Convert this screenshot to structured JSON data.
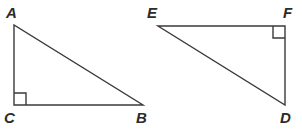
{
  "figure": {
    "background_color": "#ffffff",
    "stroke_color": "#3a3a3a",
    "stroke_width": 1.4,
    "label_color": "#2b2b2b",
    "canvas": {
      "width": 302,
      "height": 132
    },
    "shapes": [
      {
        "name": "triangle-acb",
        "type": "right-triangle",
        "vertices": [
          {
            "id": "A",
            "label": "A",
            "x": 14,
            "y": 25,
            "label_x": 6,
            "label_y": 5
          },
          {
            "id": "C",
            "label": "C",
            "x": 14,
            "y": 105,
            "label_x": 4,
            "label_y": 110
          },
          {
            "id": "B",
            "label": "B",
            "x": 143,
            "y": 105,
            "label_x": 136,
            "label_y": 110
          }
        ],
        "right_angle_at": "C",
        "right_angle_marker": {
          "x": 14,
          "y": 93,
          "size": 12
        }
      },
      {
        "name": "triangle-efd",
        "type": "right-triangle",
        "vertices": [
          {
            "id": "E",
            "label": "E",
            "x": 158,
            "y": 26,
            "label_x": 147,
            "label_y": 5
          },
          {
            "id": "F",
            "label": "F",
            "x": 285,
            "y": 26,
            "label_x": 283,
            "label_y": 5
          },
          {
            "id": "D",
            "label": "D",
            "x": 285,
            "y": 105,
            "label_x": 280,
            "label_y": 110
          }
        ],
        "right_angle_at": "F",
        "right_angle_marker": {
          "x": 273,
          "y": 26,
          "size": 12
        }
      }
    ]
  }
}
